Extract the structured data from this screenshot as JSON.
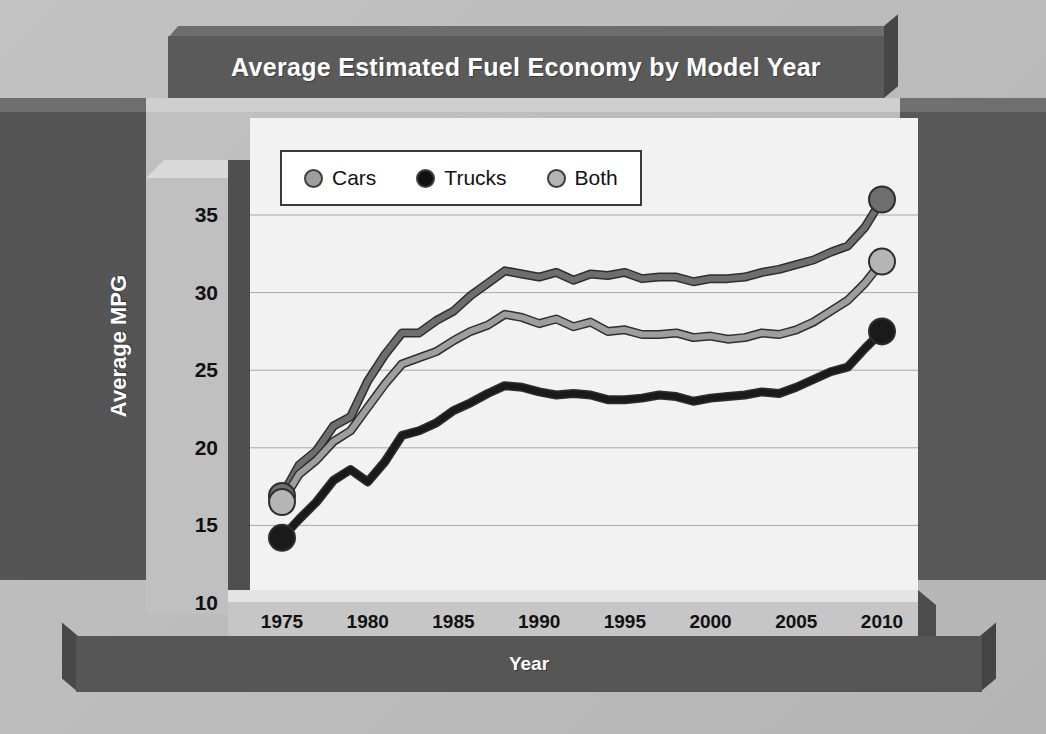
{
  "chart_data": {
    "type": "line",
    "title": "Average Estimated Fuel Economy by Model Year",
    "xlabel": "Year",
    "ylabel": "Average MPG",
    "xlim": [
      1975,
      2010
    ],
    "ylim": [
      10,
      36.5
    ],
    "grid": true,
    "legend_position": "top-left-inside",
    "xticks": [
      1975,
      1980,
      1985,
      1990,
      1995,
      2000,
      2005,
      2010
    ],
    "yticks": [
      10,
      15,
      20,
      25,
      30,
      35
    ],
    "x": [
      1975,
      1976,
      1977,
      1978,
      1979,
      1980,
      1981,
      1982,
      1983,
      1984,
      1985,
      1986,
      1987,
      1988,
      1989,
      1990,
      1991,
      1992,
      1993,
      1994,
      1995,
      1996,
      1997,
      1998,
      1999,
      2000,
      2001,
      2002,
      2003,
      2004,
      2005,
      2006,
      2007,
      2008,
      2009,
      2010
    ],
    "series": [
      {
        "name": "Cars",
        "color": "#6e6e6e",
        "marker_color": "#6e6e6e",
        "values": [
          16.9,
          18.9,
          19.8,
          21.4,
          22.0,
          24.3,
          26.0,
          27.4,
          27.4,
          28.2,
          28.8,
          29.8,
          30.6,
          31.4,
          31.2,
          31.0,
          31.3,
          30.8,
          31.2,
          31.1,
          31.3,
          30.9,
          31.0,
          31.0,
          30.7,
          30.9,
          30.9,
          31.0,
          31.3,
          31.5,
          31.8,
          32.1,
          32.6,
          33.0,
          34.2,
          36.0
        ]
      },
      {
        "name": "Trucks",
        "color": "#1a1a1a",
        "marker_color": "#1a1a1a",
        "values": [
          14.2,
          15.4,
          16.5,
          17.9,
          18.6,
          17.8,
          19.1,
          20.8,
          21.1,
          21.6,
          22.4,
          22.9,
          23.5,
          24.0,
          23.9,
          23.6,
          23.4,
          23.5,
          23.4,
          23.1,
          23.1,
          23.2,
          23.4,
          23.3,
          23.0,
          23.2,
          23.3,
          23.4,
          23.6,
          23.5,
          23.9,
          24.4,
          24.9,
          25.2,
          26.4,
          27.5
        ]
      },
      {
        "name": "Both",
        "color": "#9e9e9e",
        "marker_color": "#b5b5b5",
        "values": [
          16.5,
          18.3,
          19.2,
          20.4,
          21.1,
          22.6,
          24.1,
          25.4,
          25.8,
          26.2,
          26.9,
          27.5,
          27.9,
          28.6,
          28.4,
          28.0,
          28.3,
          27.8,
          28.1,
          27.5,
          27.6,
          27.3,
          27.3,
          27.4,
          27.1,
          27.2,
          27.0,
          27.1,
          27.4,
          27.3,
          27.6,
          28.1,
          28.8,
          29.5,
          30.6,
          32.0
        ]
      }
    ]
  },
  "chart": {
    "title": "Average Estimated Fuel Economy by Model Year",
    "x_axis_title": "Year",
    "y_axis_title": "Average MPG"
  },
  "legend": {
    "items": [
      {
        "label": "Cars",
        "swatch": "legend-dot-cars"
      },
      {
        "label": "Trucks",
        "swatch": "legend-dot-trucks"
      },
      {
        "label": "Both",
        "swatch": "legend-dot-both"
      }
    ]
  }
}
